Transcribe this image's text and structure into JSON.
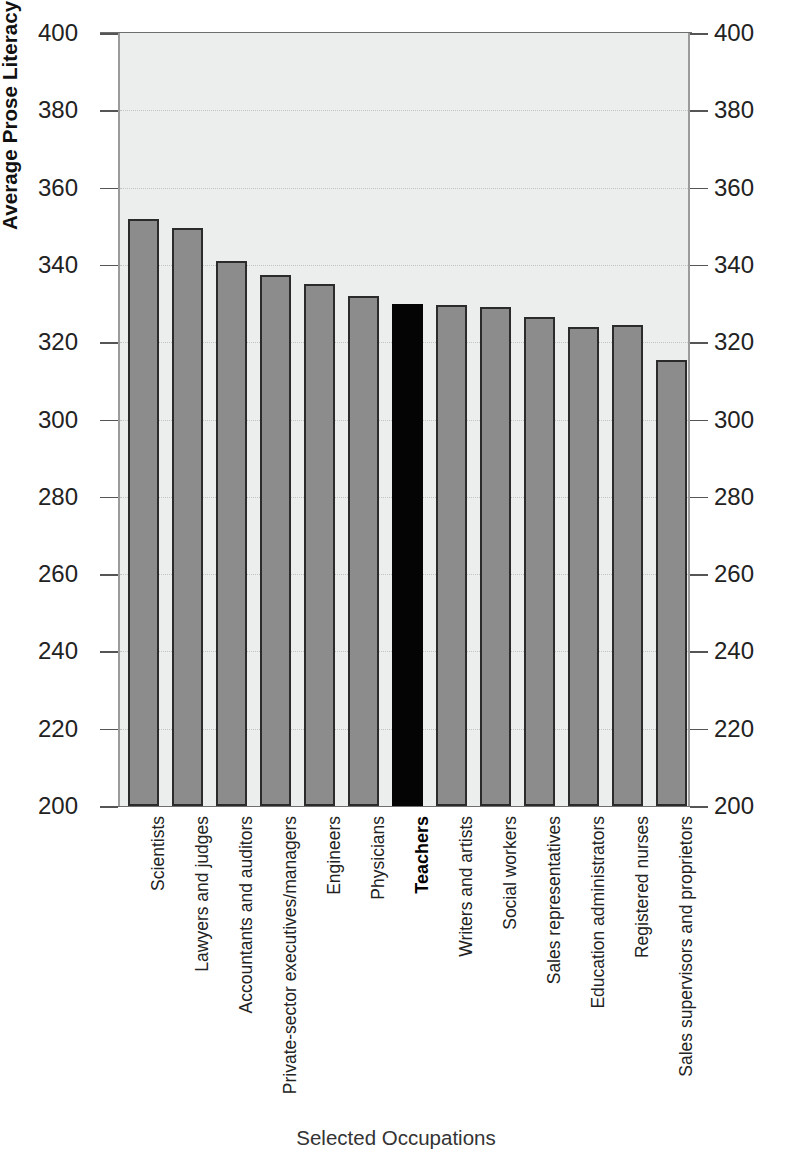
{
  "chart_data": {
    "type": "bar",
    "title": "",
    "xlabel": "Selected Occupations",
    "ylabel": "Average Prose Literacy Scores",
    "ylim": [
      200,
      400
    ],
    "ytick_step": 20,
    "grid": true,
    "legend": "none",
    "dual_y_axis": true,
    "categories": [
      "Scientists",
      "Lawyers and judges",
      "Accountants and auditors",
      "Private-sector executives/managers",
      "Engineers",
      "Physicians",
      "Teachers",
      "Writers and artists",
      "Social workers",
      "Sales representatives",
      "Education administrators",
      "Registered nurses",
      "Sales supervisors and proprietors"
    ],
    "values": [
      352,
      349.5,
      341,
      337.5,
      335,
      332,
      330,
      329.5,
      329,
      326.5,
      324,
      324.5,
      315.5
    ],
    "highlight_index": 6,
    "highlight_label": "Teachers",
    "ytick_labels": [
      "400",
      "380",
      "360",
      "340",
      "320",
      "300",
      "280",
      "260",
      "240",
      "220",
      "200"
    ],
    "ytick_values": [
      400,
      380,
      360,
      340,
      320,
      300,
      280,
      260,
      240,
      220,
      200
    ]
  },
  "colors": {
    "bar": "#8c8c8c",
    "bar_outline": "#2b2b2b",
    "highlight_bar": "#040404",
    "plot_background": "#eceded",
    "gridline": "#c2c2c2",
    "axis": "#6e6e6e",
    "text": "#222222"
  }
}
